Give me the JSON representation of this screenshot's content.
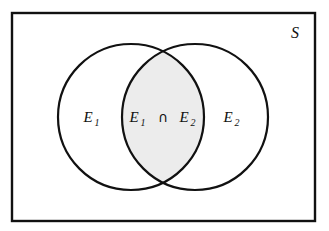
{
  "diagram": {
    "type": "venn",
    "universe": {
      "label": "S",
      "name": "sample-space",
      "border_color": "#111111",
      "fill_color": "#ffffff"
    },
    "sets": [
      {
        "id": "E1",
        "label": "E",
        "subscript": "1",
        "position": "left",
        "fill_color": "#ffffff",
        "stroke_color": "#111111"
      },
      {
        "id": "E2",
        "label": "E",
        "subscript": "2",
        "position": "right",
        "fill_color": "#ffffff",
        "stroke_color": "#111111"
      }
    ],
    "intersection": {
      "id": "E1_cap_E2",
      "left_label": "E",
      "left_subscript": "1",
      "operator": "∩",
      "right_label": "E",
      "right_subscript": "2",
      "shaded": true,
      "fill_color": "#ececec"
    },
    "colors": {
      "background": "#ffffff",
      "stroke": "#111111",
      "shade": "#ececec",
      "text": "#111111"
    }
  }
}
